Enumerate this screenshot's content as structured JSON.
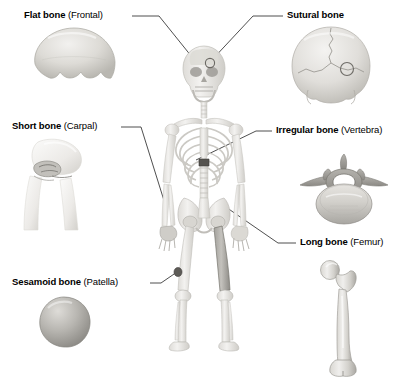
{
  "figure": {
    "background_color": "#ffffff",
    "line_color": "#3b3b3b",
    "bone_light": "#e8e7e4",
    "bone_mid": "#c9c7c2",
    "bone_dark": "#8f8d89",
    "highlight_color": "#6b6964"
  },
  "labels": {
    "flat_bone": {
      "term": "Flat bone",
      "paren": "(Frontal)"
    },
    "sutural_bone": {
      "term": "Sutural bone",
      "paren": ""
    },
    "short_bone": {
      "term": "Short bone",
      "paren": "(Carpal)"
    },
    "irregular_bone": {
      "term": "Irregular bone",
      "paren": "(Vertebra)"
    },
    "long_bone": {
      "term": "Long bone",
      "paren": "(Femur)"
    },
    "sesamoid_bone": {
      "term": "Sesamoid bone",
      "paren": "(Patella)"
    }
  },
  "specimens": {
    "frontal_bone": "flat-bone-frontal-specimen",
    "occipital_skull": "sutural-bone-skull-specimen",
    "carpal_wrist": "short-bone-carpal-specimen",
    "vertebra": "irregular-bone-vertebra-specimen",
    "femur": "long-bone-femur-specimen",
    "patella": "sesamoid-bone-patella-specimen"
  },
  "skeleton": {
    "name": "anterior-full-body-skeleton",
    "highlighted_parts": [
      "frontal-bone",
      "sutural-bone-site",
      "carpal-bones",
      "lumbar-vertebra",
      "femur",
      "patella"
    ]
  }
}
